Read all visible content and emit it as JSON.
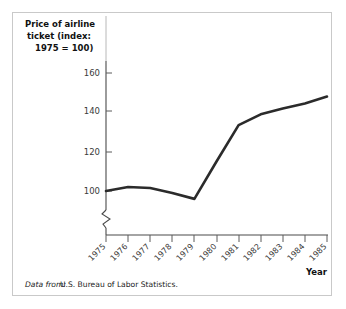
{
  "figure": {
    "border_color": "#c9c9c9",
    "background": "#ffffff"
  },
  "title": {
    "line1": "Price of airline",
    "line2": "ticket (index:",
    "line3": "1975 = 100)"
  },
  "axis": {
    "x_name": "Year",
    "y_ticks": [
      "100",
      "120",
      "140",
      "160"
    ],
    "x_ticks": [
      "1975",
      "1976",
      "1977",
      "1978",
      "1979",
      "1980",
      "1981",
      "1982",
      "1983",
      "1984",
      "1985"
    ]
  },
  "source": {
    "label": "Data from:",
    "text": "U.S. Bureau of Labor Statistics."
  },
  "chart_data": {
    "type": "line",
    "title": "Price of airline ticket (index: 1975 = 100)",
    "xlabel": "Year",
    "ylabel": "Price of airline ticket (index: 1975 = 100)",
    "categories": [
      "1975",
      "1976",
      "1977",
      "1978",
      "1979",
      "1980",
      "1981",
      "1982",
      "1983",
      "1984",
      "1985"
    ],
    "x": [
      1975,
      1976,
      1977,
      1978,
      1979,
      1980,
      1981,
      1982,
      1983,
      1984,
      1985
    ],
    "values": [
      100,
      102,
      101.5,
      99,
      96,
      115,
      133.5,
      139,
      142,
      144.5,
      148
    ],
    "series": [
      {
        "name": "Price index",
        "values": [
          100,
          102,
          101.5,
          99,
          96,
          115,
          133.5,
          139,
          142,
          144.5,
          148
        ],
        "color": "#2b2b2b"
      }
    ],
    "ylim": [
      88,
      168
    ],
    "xlim": [
      1975,
      1985
    ],
    "y_ticks": [
      100,
      120,
      140,
      160
    ],
    "grid": false,
    "legend": false,
    "y_axis_break": true,
    "line_color": "#2b2b2b"
  }
}
